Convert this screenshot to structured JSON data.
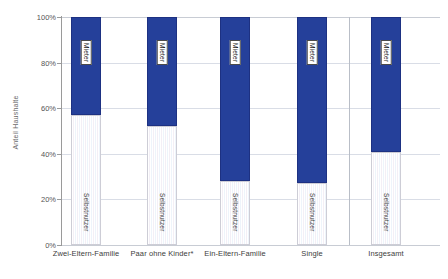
{
  "chart_data": {
    "type": "bar",
    "stacked": true,
    "title": "",
    "xlabel": "",
    "ylabel": "Anteil Haushalte",
    "ylim": [
      0,
      100
    ],
    "ytick_labels": [
      "0%",
      "20%",
      "40%",
      "60%",
      "80%",
      "100%"
    ],
    "ytick_values": [
      0,
      20,
      40,
      60,
      80,
      100
    ],
    "grid": true,
    "legend_position": "in-bar-labels",
    "categories": [
      "Zwei-Eltern-Familie",
      "Paar ohne Kinder*",
      "Ein-Eltern-Familie",
      "Single",
      "Insgesamt"
    ],
    "series": [
      {
        "name": "Selbstnutzer",
        "color": "#f4f2f7",
        "values": [
          57,
          52,
          28,
          27,
          41
        ]
      },
      {
        "name": "Mieter",
        "color": "#25409a",
        "values": [
          43,
          48,
          72,
          73,
          59
        ]
      }
    ],
    "segment_labels": {
      "mieter": "Mieter",
      "selbstnutzer": "Selbstnutzer"
    },
    "separator_before_category": "Insgesamt"
  }
}
